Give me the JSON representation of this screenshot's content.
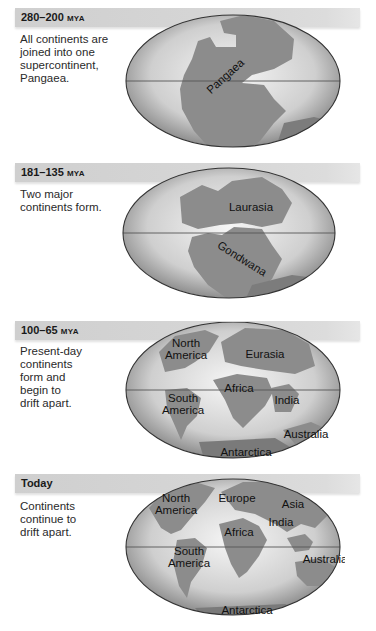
{
  "figure": {
    "panels": [
      {
        "period": "280–200",
        "unit": "MYA",
        "description": "All continents are joined into one supercontinent, Pangaea.",
        "description_lines": [
          "All continents are",
          "joined into one",
          "supercontinent,",
          "Pangaea."
        ],
        "map_labels": [
          "Pangaea"
        ]
      },
      {
        "period": "181–135",
        "unit": "MYA",
        "description": "Two major continents form.",
        "description_lines": [
          "Two major",
          "continents form."
        ],
        "map_labels": [
          "Laurasia",
          "Gondwana"
        ]
      },
      {
        "period": "100–65",
        "unit": "MYA",
        "description": "Present-day continents form and begin to drift apart.",
        "description_lines": [
          "Present-day",
          "continents",
          "form and",
          "begin to",
          "drift apart."
        ],
        "map_labels": [
          "North",
          "America",
          "Eurasia",
          "Africa",
          "South",
          "America",
          "India",
          "Australia",
          "Antarctica"
        ]
      },
      {
        "period": "Today",
        "unit": "",
        "description": "Continents continue to drift apart.",
        "description_lines": [
          "Continents",
          "continue to",
          "drift apart."
        ],
        "map_labels": [
          "North",
          "America",
          "Europe",
          "Asia",
          "India",
          "Africa",
          "South",
          "America",
          "Australia",
          "Antarctica"
        ]
      }
    ]
  },
  "colors": {
    "header_bar": "#d4d4d4",
    "land": "#8c8c8c",
    "ocean_center": "#f4f4f4",
    "ocean_edge": "#9c9c9c",
    "outline": "#333333"
  }
}
